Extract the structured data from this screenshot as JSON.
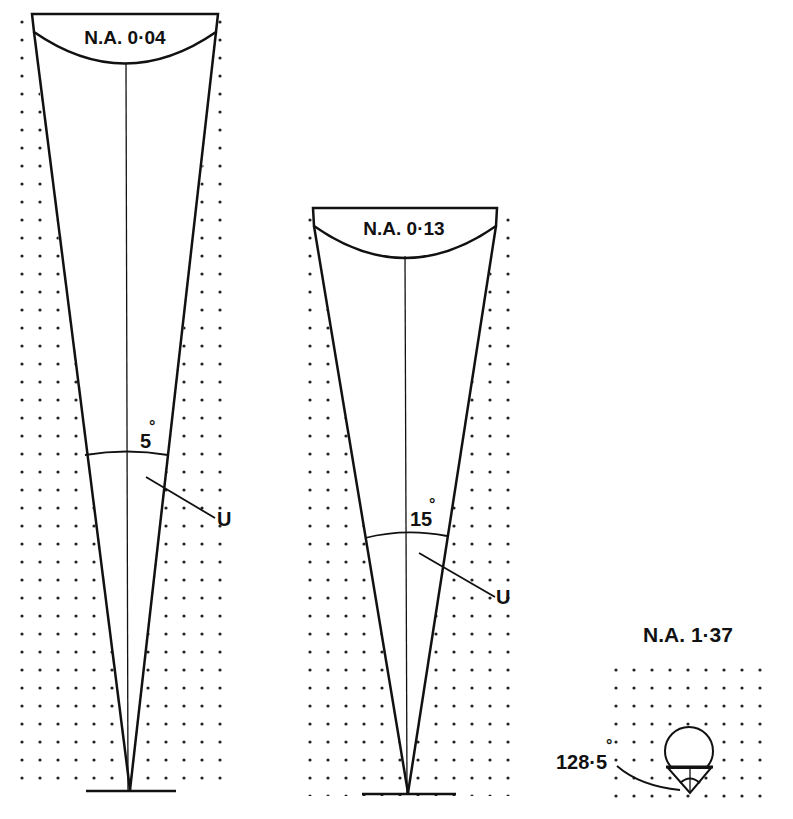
{
  "diagram": {
    "ink_color": "#111111",
    "background": "#ffffff",
    "panels": [
      {
        "id": "na-004",
        "label": "N.A. 0·04",
        "angle_label": "5",
        "degree_symbol": "°",
        "pointer_label": "U"
      },
      {
        "id": "na-013",
        "label": "N.A. 0·13",
        "angle_label": "15",
        "degree_symbol": "°",
        "pointer_label": "U"
      },
      {
        "id": "na-137",
        "label": "N.A. 1·37",
        "angle_label": "128·5",
        "degree_symbol": "°"
      }
    ]
  }
}
